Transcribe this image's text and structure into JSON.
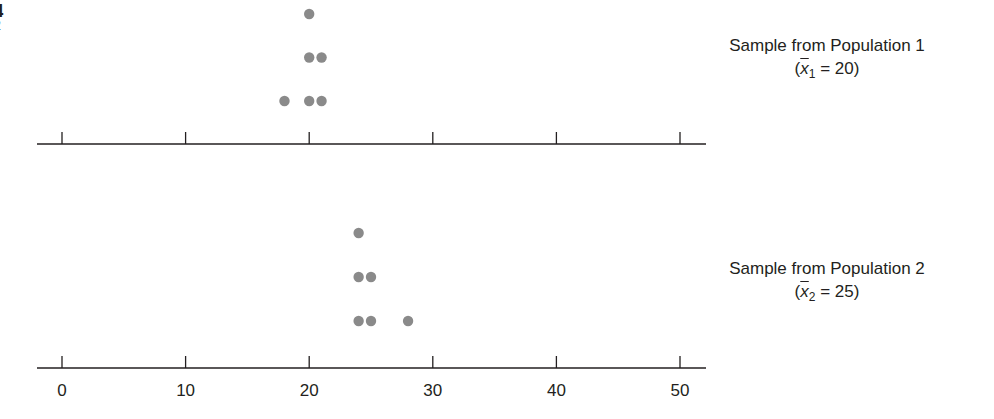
{
  "corner_text": {
    "line1": "4",
    "line2": "2"
  },
  "chart_data": [
    {
      "type": "scatter",
      "subtype": "dot_plot",
      "title": "Sample from Population 1",
      "mean_label": {
        "open": "(",
        "var": "x",
        "sub": "1",
        "rest": " = 20)"
      },
      "mean": 20,
      "x": [
        18,
        20,
        20,
        20,
        21,
        21
      ],
      "y_stack": [
        1,
        1,
        2,
        3,
        1,
        2
      ],
      "xlim": [
        0,
        50
      ],
      "xticks": [
        0,
        10,
        20,
        30,
        40,
        50
      ],
      "xtick_labels_shown": false,
      "grid": false,
      "dot_color": "#8a8a8a"
    },
    {
      "type": "scatter",
      "subtype": "dot_plot",
      "title": "Sample from Population 2",
      "mean_label": {
        "open": "(",
        "var": "x",
        "sub": "2",
        "rest": " = 25)"
      },
      "mean": 25,
      "x": [
        24,
        24,
        24,
        25,
        25,
        28
      ],
      "y_stack": [
        1,
        2,
        3,
        1,
        2,
        1
      ],
      "xlim": [
        0,
        50
      ],
      "xticks": [
        0,
        10,
        20,
        30,
        40,
        50
      ],
      "xtick_labels": [
        "0",
        "10",
        "20",
        "30",
        "40",
        "50"
      ],
      "grid": false,
      "dot_color": "#8a8a8a"
    }
  ],
  "style": {
    "axis_color": "#231f20",
    "dot_color": "#8a8a8a"
  }
}
